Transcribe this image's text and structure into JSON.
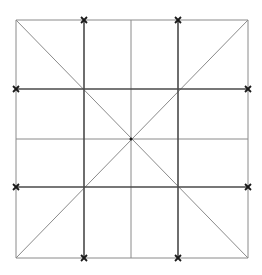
{
  "diagram": {
    "title": "",
    "width": 262,
    "height": 275,
    "colors": {
      "background": "#ffffff",
      "light_line": "#8a8a8a",
      "dark_line": "#4a4a4a",
      "marker": "#1a1a1a"
    },
    "square": {
      "x0": 16,
      "y0": 20,
      "x1": 248,
      "y1": 258
    },
    "light_lines": [
      {
        "name": "border-top",
        "x1": 16,
        "y1": 20,
        "x2": 248,
        "y2": 20
      },
      {
        "name": "border-bottom",
        "x1": 16,
        "y1": 258,
        "x2": 248,
        "y2": 258
      },
      {
        "name": "border-left",
        "x1": 16,
        "y1": 20,
        "x2": 16,
        "y2": 258
      },
      {
        "name": "border-right",
        "x1": 248,
        "y1": 20,
        "x2": 248,
        "y2": 258
      },
      {
        "name": "center-vertical",
        "x1": 131,
        "y1": 20,
        "x2": 131,
        "y2": 258
      },
      {
        "name": "center-horizontal",
        "x1": 16,
        "y1": 139,
        "x2": 248,
        "y2": 139
      },
      {
        "name": "diagonal-main",
        "x1": 16,
        "y1": 20,
        "x2": 248,
        "y2": 258
      },
      {
        "name": "diagonal-anti",
        "x1": 248,
        "y1": 20,
        "x2": 16,
        "y2": 258
      }
    ],
    "dark_lines": [
      {
        "name": "grid-vertical-left",
        "x1": 84,
        "y1": 20,
        "x2": 84,
        "y2": 258
      },
      {
        "name": "grid-vertical-right",
        "x1": 178,
        "y1": 20,
        "x2": 178,
        "y2": 258
      },
      {
        "name": "grid-horizontal-top",
        "x1": 16,
        "y1": 89,
        "x2": 248,
        "y2": 89
      },
      {
        "name": "grid-horizontal-bottom",
        "x1": 16,
        "y1": 187,
        "x2": 248,
        "y2": 187
      }
    ],
    "markers": [
      {
        "name": "marker-top-left",
        "x": 84,
        "y": 20
      },
      {
        "name": "marker-top-right",
        "x": 178,
        "y": 20
      },
      {
        "name": "marker-left-top",
        "x": 16,
        "y": 89
      },
      {
        "name": "marker-right-top",
        "x": 248,
        "y": 89
      },
      {
        "name": "marker-left-bottom",
        "x": 16,
        "y": 187
      },
      {
        "name": "marker-right-bottom",
        "x": 248,
        "y": 187
      },
      {
        "name": "marker-bottom-left",
        "x": 84,
        "y": 258
      },
      {
        "name": "marker-bottom-right",
        "x": 178,
        "y": 258
      }
    ],
    "center_point": {
      "x": 131,
      "y": 139
    }
  }
}
